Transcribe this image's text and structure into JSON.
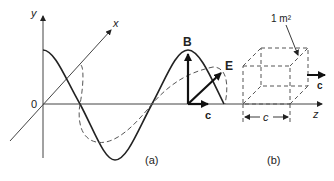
{
  "figure": {
    "panel_a": {
      "caption": "(a)",
      "axis_y_label": "y",
      "axis_x_label": "x",
      "origin_label": "0",
      "vector_b_label": "B",
      "vector_e_label": "E",
      "vector_c_label": "c"
    },
    "panel_b": {
      "caption": "(b)",
      "area_label": "1 m²",
      "length_label": "c",
      "direction_label": "c",
      "axis_z_label": "z"
    },
    "colors": {
      "ink": "#222222",
      "dashed": "#555555",
      "axis": "#444444"
    }
  }
}
